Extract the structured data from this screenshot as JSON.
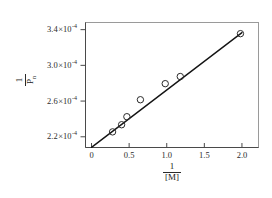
{
  "chart_data": {
    "type": "scatter",
    "title": "",
    "subtitle": "",
    "xlabel_numerator": "1",
    "xlabel_denominator": "[M]",
    "ylabel_numerator": "1",
    "ylabel_denominator": "P",
    "ylabel_denominator_sub": "n",
    "x": [
      0.28,
      0.4,
      0.47,
      0.65,
      0.98,
      1.18,
      1.98
    ],
    "y": [
      0.0002255,
      0.0002335,
      0.0002425,
      0.0002615,
      0.0002795,
      0.0002875,
      0.0003355
    ],
    "y_scale_exponent": "-4",
    "xlim": [
      -0.08,
      2.22
    ],
    "ylim": [
      0.000208,
      0.000348
    ],
    "xticks": [
      0,
      0.5,
      1.0,
      1.5,
      2.0
    ],
    "xtick_labels": [
      "0",
      "0.5",
      "1.0",
      "1.5",
      "2.0"
    ],
    "yticks": [
      0.00022,
      0.00026,
      0.0003,
      0.00034
    ],
    "ytick_mantissas": [
      "2.2",
      "2.6",
      "3.0",
      "3.4"
    ],
    "ytick_multiplier": "×10",
    "ytick_exponent": "-4",
    "grid": false,
    "legend": null,
    "fit_line": {
      "intercept": 0.0002082,
      "slope": 6.42e-05,
      "x_start": 0.0,
      "x_end": 2.0
    },
    "marker": "open-circle",
    "marker_radius_px": 3.2,
    "line_color": "#141414",
    "marker_color": "#2b2b2b",
    "frame_color": "#9a9a9a",
    "background_color": "#ffffff"
  }
}
